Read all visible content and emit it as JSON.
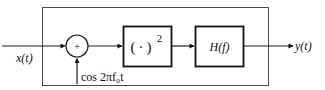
{
  "diagram": {
    "type": "block-diagram",
    "input": {
      "label": "x(t)"
    },
    "summer": {
      "symbol": "+",
      "side_input_label": "cos 2πf₀t"
    },
    "squarer": {
      "label_open": "(",
      "label_dot": "·",
      "label_close": ")",
      "exponent": "2"
    },
    "filter": {
      "label": "H(f)"
    },
    "output": {
      "label": "y(t)"
    }
  },
  "colors": {
    "stroke": "#111111",
    "outer_box": "#4a4a4a",
    "background": "#ffffff"
  }
}
